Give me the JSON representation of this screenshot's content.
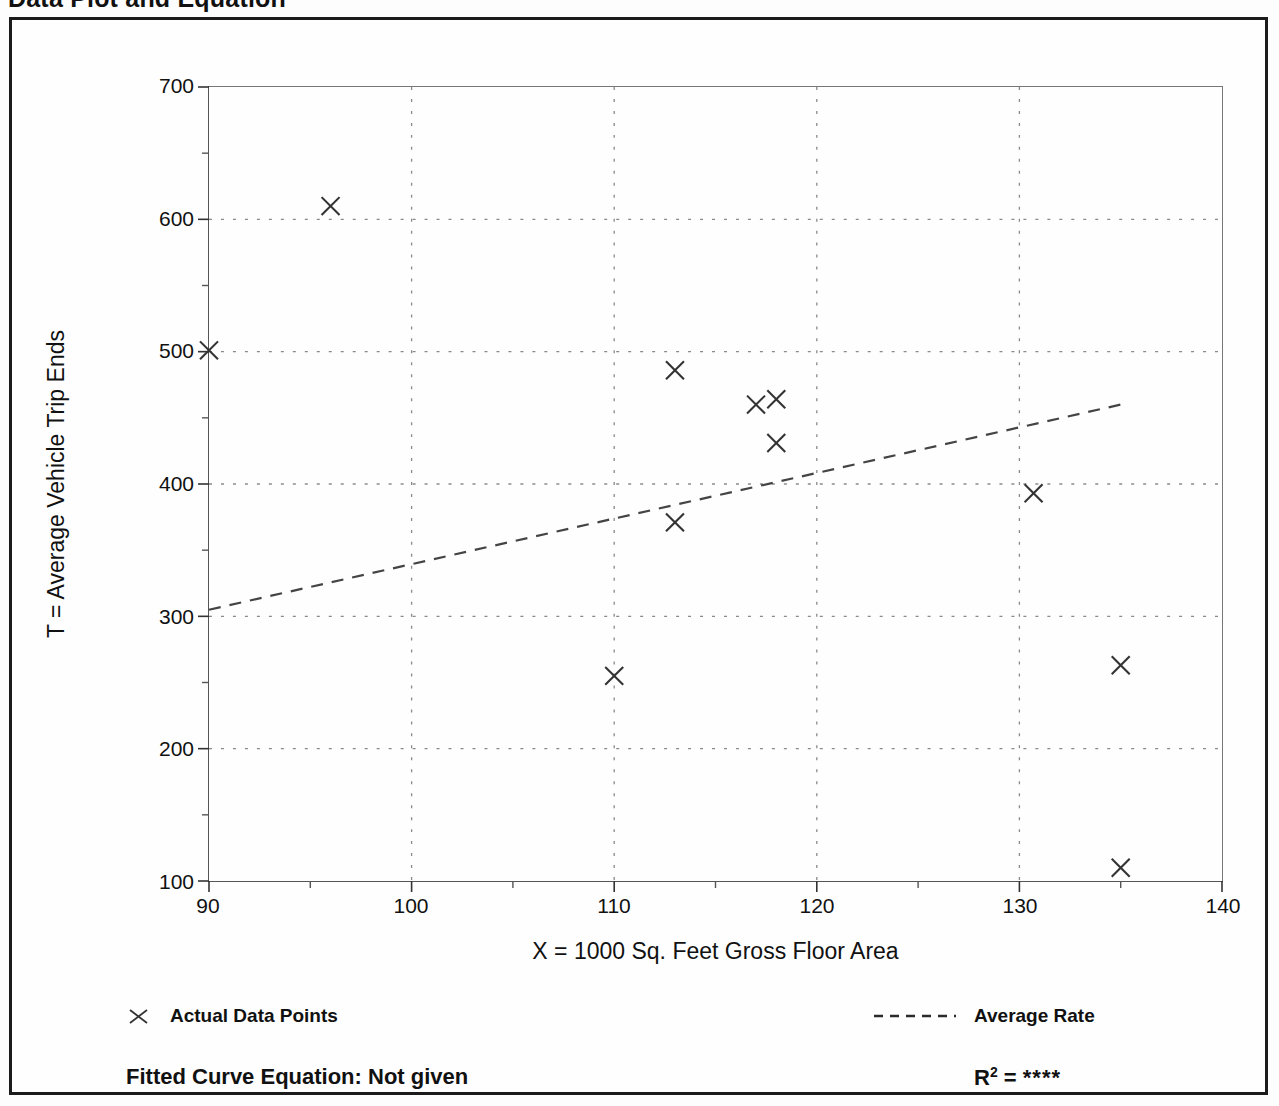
{
  "title": "Data Plot and Equation",
  "axis": {
    "x_label": "X = 1000 Sq. Feet Gross Floor Area",
    "y_label": "T = Average Vehicle Trip Ends"
  },
  "legend": {
    "points_label": "Actual Data Points",
    "points_marker": "x-cross-marker",
    "line_label": "Average Rate",
    "line_marker": "dashed-line-sample"
  },
  "footer": {
    "equation_label": "Fitted Curve Equation:",
    "equation_value": "Not given",
    "equation_full": "Fitted Curve Equation:  Not given",
    "r2_label": "R",
    "r2_exponent": "2",
    "r2_equals": "=",
    "r2_value": "****"
  },
  "chart_data": {
    "type": "scatter",
    "title": "Data Plot and Equation",
    "xlabel": "X = 1000 Sq. Feet Gross Floor Area",
    "ylabel": "T = Average Vehicle Trip Ends",
    "xlim": [
      90,
      140
    ],
    "ylim": [
      100,
      700
    ],
    "xticks": [
      90,
      100,
      110,
      120,
      130,
      140
    ],
    "xticklabels": [
      "90",
      "100",
      "110",
      "120",
      "130",
      "140"
    ],
    "yticks": [
      100,
      200,
      300,
      400,
      500,
      600,
      700
    ],
    "yticklabels": [
      "100",
      "200",
      "300",
      "400",
      "500",
      "600",
      "700"
    ],
    "x_minor_ticks": [
      95,
      105,
      115,
      125,
      135
    ],
    "y_minor_ticks": [
      150,
      250,
      350,
      450,
      550,
      650
    ],
    "grid": true,
    "grid_style": "dotted",
    "legend_position": "below-axes",
    "series": [
      {
        "name": "Actual Data Points",
        "type": "scatter",
        "marker": "x",
        "color": "#333333",
        "points": [
          {
            "x": 90.0,
            "y": 501
          },
          {
            "x": 96.0,
            "y": 610
          },
          {
            "x": 110.0,
            "y": 255
          },
          {
            "x": 113.0,
            "y": 486
          },
          {
            "x": 113.0,
            "y": 371
          },
          {
            "x": 117.0,
            "y": 460
          },
          {
            "x": 118.0,
            "y": 464
          },
          {
            "x": 118.0,
            "y": 431
          },
          {
            "x": 130.7,
            "y": 393
          },
          {
            "x": 135.0,
            "y": 263
          },
          {
            "x": 135.0,
            "y": 110
          }
        ]
      },
      {
        "name": "Average Rate",
        "type": "line",
        "style": "dashed",
        "color": "#444444",
        "x": [
          90,
          135
        ],
        "y": [
          305,
          460
        ]
      }
    ],
    "annotations": [
      {
        "text": "Fitted Curve Equation:  Not given",
        "position": "footer-left"
      },
      {
        "text": "R2 = ****",
        "position": "footer-right"
      }
    ]
  }
}
